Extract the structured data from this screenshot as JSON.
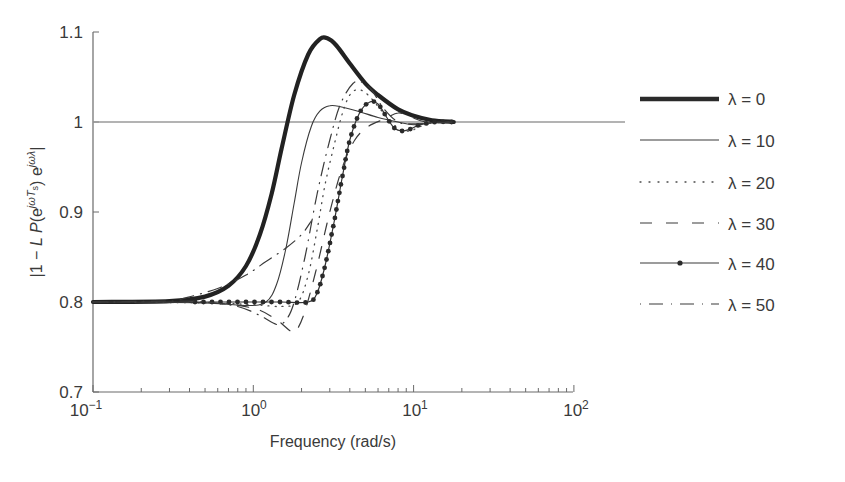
{
  "chart_data": {
    "type": "line",
    "title": "",
    "xlabel": "Frequency (rad/s)",
    "ylabel": "|1 − L P(e^{jωTs}) e^{jωλ}|",
    "xscale": "log",
    "xlim": [
      0.1,
      100
    ],
    "ylim": [
      0.7,
      1.1
    ],
    "x_ticks": [
      "10^-1",
      "10^0",
      "10^1",
      "10^2"
    ],
    "y_ticks": [
      "0.7",
      "0.8",
      "0.9",
      "1",
      "1.1"
    ],
    "reference_line": {
      "y": 1.0,
      "color": "#9a9a9a"
    },
    "grid": false,
    "legend_position": "right",
    "series": [
      {
        "name": "λ = 0",
        "style": "thick-solid",
        "points": [
          [
            0.1,
            0.8
          ],
          [
            0.3,
            0.801
          ],
          [
            0.5,
            0.806
          ],
          [
            0.7,
            0.818
          ],
          [
            0.9,
            0.84
          ],
          [
            1.1,
            0.875
          ],
          [
            1.3,
            0.92
          ],
          [
            1.5,
            0.97
          ],
          [
            1.8,
            1.03
          ],
          [
            2.2,
            1.075
          ],
          [
            2.6,
            1.092
          ],
          [
            2.9,
            1.093
          ],
          [
            3.3,
            1.085
          ],
          [
            4,
            1.065
          ],
          [
            5,
            1.043
          ],
          [
            6,
            1.03
          ],
          [
            8,
            1.014
          ],
          [
            10,
            1.007
          ],
          [
            13,
            1.002
          ],
          [
            17.8,
            1.0
          ]
        ]
      },
      {
        "name": "λ = 10",
        "style": "thin-solid",
        "points": [
          [
            0.1,
            0.8
          ],
          [
            0.5,
            0.799
          ],
          [
            0.9,
            0.796
          ],
          [
            1.2,
            0.8
          ],
          [
            1.4,
            0.82
          ],
          [
            1.6,
            0.86
          ],
          [
            1.8,
            0.91
          ],
          [
            2.0,
            0.955
          ],
          [
            2.3,
            0.995
          ],
          [
            2.6,
            1.012
          ],
          [
            3.0,
            1.018
          ],
          [
            3.5,
            1.017
          ],
          [
            4.5,
            1.012
          ],
          [
            6,
            1.005
          ],
          [
            8,
            1.0
          ],
          [
            10,
            0.997
          ],
          [
            13,
            0.999
          ],
          [
            17.8,
            1.0
          ]
        ]
      },
      {
        "name": "λ = 20",
        "style": "dotted",
        "points": [
          [
            0.1,
            0.8
          ],
          [
            0.5,
            0.799
          ],
          [
            1.0,
            0.797
          ],
          [
            1.5,
            0.795
          ],
          [
            1.9,
            0.8
          ],
          [
            2.2,
            0.83
          ],
          [
            2.5,
            0.88
          ],
          [
            2.8,
            0.93
          ],
          [
            3.2,
            0.975
          ],
          [
            3.6,
            1.01
          ],
          [
            4.0,
            1.03
          ],
          [
            4.5,
            1.036
          ],
          [
            5.2,
            1.03
          ],
          [
            6.5,
            1.01
          ],
          [
            8,
            0.993
          ],
          [
            9.5,
            0.99
          ],
          [
            11,
            0.995
          ],
          [
            14,
            0.999
          ],
          [
            17.8,
            1.0
          ]
        ]
      },
      {
        "name": "λ = 30",
        "style": "dashed",
        "points": [
          [
            0.1,
            0.8
          ],
          [
            0.5,
            0.799
          ],
          [
            1.0,
            0.793
          ],
          [
            1.4,
            0.78
          ],
          [
            1.7,
            0.768
          ],
          [
            1.85,
            0.768
          ],
          [
            2.1,
            0.79
          ],
          [
            2.5,
            0.84
          ],
          [
            3.0,
            0.9
          ],
          [
            3.6,
            0.95
          ],
          [
            4.3,
            0.98
          ],
          [
            5.2,
            0.995
          ],
          [
            6.5,
            1.003
          ],
          [
            8,
            1.01
          ],
          [
            9.5,
            1.006
          ],
          [
            12,
            1.0
          ],
          [
            17.8,
            1.0
          ]
        ]
      },
      {
        "name": "λ = 40",
        "style": "solid-with-dots",
        "points": [
          [
            0.1,
            0.8
          ],
          [
            0.5,
            0.8
          ],
          [
            1.0,
            0.8
          ],
          [
            1.5,
            0.8
          ],
          [
            2.2,
            0.8
          ],
          [
            2.5,
            0.81
          ],
          [
            2.8,
            0.84
          ],
          [
            3.2,
            0.89
          ],
          [
            3.6,
            0.94
          ],
          [
            4.0,
            0.98
          ],
          [
            4.6,
            1.01
          ],
          [
            5.3,
            1.022
          ],
          [
            6.0,
            1.02
          ],
          [
            6.8,
            1.005
          ],
          [
            7.6,
            0.993
          ],
          [
            8.5,
            0.99
          ],
          [
            9.5,
            0.992
          ],
          [
            11,
            0.997
          ],
          [
            14,
            1.0
          ],
          [
            17.8,
            1.0
          ]
        ]
      },
      {
        "name": "λ = 50",
        "style": "dash-dot",
        "points": [
          [
            0.1,
            0.8
          ],
          [
            0.35,
            0.801
          ],
          [
            0.5,
            0.8
          ],
          [
            0.8,
            0.795
          ],
          [
            1.1,
            0.785
          ],
          [
            1.4,
            0.775
          ],
          [
            1.6,
            0.78
          ],
          [
            1.8,
            0.8
          ],
          [
            2.1,
            0.85
          ],
          [
            2.5,
            0.92
          ],
          [
            3.0,
            0.98
          ],
          [
            3.5,
            1.02
          ],
          [
            4.2,
            1.043
          ],
          [
            4.8,
            1.044
          ],
          [
            5.5,
            1.035
          ],
          [
            6.5,
            1.015
          ],
          [
            8,
            1.0
          ],
          [
            10,
            0.998
          ],
          [
            17.8,
            1.0
          ]
        ]
      },
      {
        "name": "λ = 50 (upper branch)",
        "style": "dash-dot",
        "points": [
          [
            0.35,
            0.803
          ],
          [
            0.6,
            0.815
          ],
          [
            0.9,
            0.83
          ],
          [
            1.2,
            0.845
          ],
          [
            1.6,
            0.86
          ],
          [
            2.0,
            0.875
          ],
          [
            2.3,
            0.89
          ]
        ]
      }
    ]
  },
  "axes": {
    "x_tick_labels": [
      {
        "base": "10",
        "exp": "−1"
      },
      {
        "base": "10",
        "exp": "0"
      },
      {
        "base": "10",
        "exp": "1"
      },
      {
        "base": "10",
        "exp": "2"
      }
    ],
    "y_tick_labels": [
      "0.7",
      "0.8",
      "0.9",
      "1",
      "1.1"
    ],
    "xlabel": "Frequency (rad/s)"
  },
  "legend": {
    "items": [
      {
        "label": "λ = 0",
        "style": "thick-solid"
      },
      {
        "label": "λ = 10",
        "style": "thin-solid"
      },
      {
        "label": "λ = 20",
        "style": "dotted"
      },
      {
        "label": "λ = 30",
        "style": "dashed"
      },
      {
        "label": "λ = 40",
        "style": "solid-with-dots"
      },
      {
        "label": "λ = 50",
        "style": "dash-dot"
      }
    ]
  },
  "colors": {
    "axis": "#6a6a6a",
    "line": "#2a2a2a",
    "reference": "#9a9a9a",
    "text": "#3a3a3a"
  }
}
